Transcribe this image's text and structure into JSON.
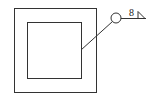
{
  "diagram": {
    "type": "welding-symbol-drawing",
    "outer_square": {
      "x": 14,
      "y": 8,
      "w": 82,
      "h": 84
    },
    "inner_square": {
      "x": 27,
      "y": 22,
      "w": 54,
      "h": 56
    },
    "leader": {
      "from": [
        81,
        50
      ],
      "to": [
        113,
        21
      ]
    },
    "all_around_circle": {
      "cx": 116,
      "cy": 18,
      "r": 5
    },
    "reference_line": {
      "from": [
        121,
        18
      ],
      "to": [
        146,
        18
      ]
    },
    "weld_size_label": "8",
    "weld_symbol": "fillet-triangle",
    "stroke_color": "#333333"
  }
}
